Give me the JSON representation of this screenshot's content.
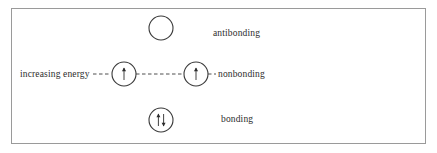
{
  "diagram": {
    "border_color": "#9a9a9a",
    "text_color": "#2c2c2c",
    "line_color": "#3a3a3a",
    "labels": {
      "increasing_energy": "increasing energy",
      "antibonding": "antibonding",
      "nonbonding": "nonbonding",
      "bonding": "bonding"
    },
    "orbitals": [
      {
        "name": "antibonding-orbital",
        "level": "antibonding",
        "cx": 161,
        "cy": 28,
        "r": 12,
        "electrons": "",
        "electron_count": 0
      },
      {
        "name": "nonbonding-orbital-left",
        "level": "nonbonding",
        "cx": 124,
        "cy": 74,
        "r": 12,
        "electrons": "↑",
        "electron_count": 1
      },
      {
        "name": "nonbonding-orbital-right",
        "level": "nonbonding",
        "cx": 196,
        "cy": 74,
        "r": 12,
        "electrons": "↑",
        "electron_count": 1
      },
      {
        "name": "bonding-orbital",
        "level": "bonding",
        "cx": 161,
        "cy": 120,
        "r": 12,
        "electrons": "↑↓",
        "electron_count": 2
      }
    ]
  }
}
